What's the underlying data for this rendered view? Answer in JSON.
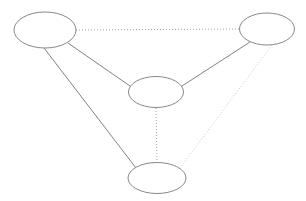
{
  "diagram": {
    "type": "node-link-graph",
    "background_color": "#ffffff",
    "width": 306,
    "height": 201,
    "node_style": {
      "shape": "ellipse",
      "fill": "#ffffff",
      "stroke_color": "#7a7a80",
      "stroke_width": 0.9
    },
    "edge_styles": {
      "solid": {
        "stroke_color": "#73737b",
        "stroke_width": 0.9,
        "dash": "none"
      },
      "dotted_dark": {
        "stroke_color": "#9a9aa2",
        "stroke_width": 0.9,
        "dash": "1 2"
      },
      "dotted_light": {
        "stroke_color": "#c0c0c6",
        "stroke_width": 0.9,
        "dash": "1 2"
      }
    },
    "nodes": [
      {
        "id": "node-top-left",
        "label": "",
        "cx": 45,
        "cy": 30,
        "rx": 31,
        "ry": 18
      },
      {
        "id": "node-top-right",
        "label": "",
        "cx": 267,
        "cy": 29,
        "rx": 27.5,
        "ry": 16
      },
      {
        "id": "node-center",
        "label": "",
        "cx": 156,
        "cy": 92,
        "rx": 27.5,
        "ry": 15.5
      },
      {
        "id": "node-bottom",
        "label": "",
        "cx": 157,
        "cy": 178,
        "rx": 29,
        "ry": 15.5
      }
    ],
    "edges": [
      {
        "id": "edge-top-left-to-top-right",
        "from": "node-top-left",
        "to": "node-top-right",
        "style": "dotted_dark",
        "x1": 76,
        "y1": 30,
        "x2": 240,
        "y2": 29
      },
      {
        "id": "edge-top-left-to-center",
        "from": "node-top-left",
        "to": "node-center",
        "style": "solid",
        "x1": 68,
        "y1": 43,
        "x2": 130,
        "y2": 86
      },
      {
        "id": "edge-top-left-to-bottom",
        "from": "node-top-left",
        "to": "node-bottom",
        "style": "solid",
        "x1": 44,
        "y1": 48,
        "x2": 136,
        "y2": 168
      },
      {
        "id": "edge-top-right-to-center",
        "from": "node-top-right",
        "to": "node-center",
        "style": "solid",
        "x1": 250,
        "y1": 42,
        "x2": 182,
        "y2": 86
      },
      {
        "id": "edge-top-right-to-bottom",
        "from": "node-top-right",
        "to": "node-bottom",
        "style": "dotted_light",
        "x1": 272,
        "y1": 45,
        "x2": 180,
        "y2": 168
      },
      {
        "id": "edge-center-to-bottom",
        "from": "node-center",
        "to": "node-bottom",
        "style": "dotted_dark",
        "x1": 156,
        "y1": 108,
        "x2": 157,
        "y2": 163
      }
    ]
  }
}
